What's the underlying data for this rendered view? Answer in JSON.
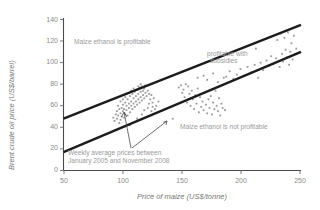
{
  "chart_data": {
    "type": "scatter",
    "title": "",
    "xlabel": "Price of maize (US$/tonne)",
    "ylabel": "Brent crude oil price (US$/barrel)",
    "xlim": [
      50,
      250
    ],
    "ylim": [
      0,
      140
    ],
    "xticks": [
      50,
      100,
      150,
      200,
      250
    ],
    "yticks": [
      0,
      20,
      40,
      60,
      80,
      100,
      120,
      140
    ],
    "grid": false,
    "legend": "none",
    "series": [
      {
        "name": "Weekly average prices",
        "type": "scatter",
        "marker": "square",
        "color": "#9a9a9a",
        "points": [
          [
            92,
            49
          ],
          [
            93,
            46
          ],
          [
            94,
            52
          ],
          [
            95,
            48
          ],
          [
            95,
            55
          ],
          [
            96,
            51
          ],
          [
            97,
            44
          ],
          [
            97,
            57
          ],
          [
            98,
            53
          ],
          [
            98,
            47
          ],
          [
            99,
            58
          ],
          [
            99,
            50
          ],
          [
            100,
            55
          ],
          [
            100,
            61
          ],
          [
            101,
            49
          ],
          [
            101,
            57
          ],
          [
            102,
            52
          ],
          [
            102,
            63
          ],
          [
            103,
            56
          ],
          [
            103,
            60
          ],
          [
            104,
            51
          ],
          [
            104,
            66
          ],
          [
            105,
            58
          ],
          [
            105,
            62
          ],
          [
            106,
            54
          ],
          [
            106,
            69
          ],
          [
            107,
            60
          ],
          [
            107,
            64
          ],
          [
            108,
            57
          ],
          [
            108,
            71
          ],
          [
            109,
            62
          ],
          [
            109,
            67
          ],
          [
            110,
            59
          ],
          [
            110,
            73
          ],
          [
            111,
            64
          ],
          [
            111,
            69
          ],
          [
            112,
            61
          ],
          [
            112,
            75
          ],
          [
            113,
            66
          ],
          [
            113,
            71
          ],
          [
            114,
            63
          ],
          [
            114,
            77
          ],
          [
            115,
            68
          ],
          [
            115,
            73
          ],
          [
            116,
            65
          ],
          [
            116,
            78
          ],
          [
            117,
            70
          ],
          [
            117,
            74
          ],
          [
            118,
            67
          ],
          [
            118,
            76
          ],
          [
            119,
            72
          ],
          [
            120,
            69
          ],
          [
            121,
            74
          ],
          [
            122,
            71
          ],
          [
            123,
            66
          ],
          [
            124,
            70
          ],
          [
            125,
            63
          ],
          [
            126,
            67
          ],
          [
            128,
            60
          ],
          [
            130,
            64
          ],
          [
            106,
            42
          ],
          [
            110,
            45
          ],
          [
            112,
            48
          ],
          [
            116,
            52
          ],
          [
            118,
            56
          ],
          [
            121,
            58
          ],
          [
            124,
            55
          ],
          [
            127,
            57
          ],
          [
            96,
            60
          ],
          [
            98,
            64
          ],
          [
            100,
            66
          ],
          [
            102,
            68
          ],
          [
            104,
            72
          ],
          [
            107,
            74
          ],
          [
            109,
            76
          ],
          [
            113,
            78
          ],
          [
            115,
            80
          ],
          [
            119,
            79
          ],
          [
            122,
            62
          ],
          [
            125,
            59
          ],
          [
            142,
            48
          ],
          [
            147,
            77
          ],
          [
            149,
            79
          ],
          [
            150,
            72
          ],
          [
            151,
            75
          ],
          [
            152,
            68
          ],
          [
            153,
            80
          ],
          [
            154,
            63
          ],
          [
            155,
            78
          ],
          [
            156,
            71
          ],
          [
            157,
            60
          ],
          [
            158,
            74
          ],
          [
            159,
            66
          ],
          [
            160,
            57
          ],
          [
            161,
            70
          ],
          [
            162,
            62
          ],
          [
            163,
            76
          ],
          [
            164,
            54
          ],
          [
            165,
            68
          ],
          [
            166,
            59
          ],
          [
            167,
            64
          ],
          [
            168,
            56
          ],
          [
            169,
            72
          ],
          [
            170,
            61
          ],
          [
            171,
            53
          ],
          [
            172,
            66
          ],
          [
            173,
            58
          ],
          [
            174,
            69
          ],
          [
            175,
            52
          ],
          [
            176,
            63
          ],
          [
            177,
            57
          ],
          [
            178,
            74
          ],
          [
            179,
            60
          ],
          [
            180,
            55
          ],
          [
            181,
            67
          ],
          [
            182,
            51
          ],
          [
            183,
            62
          ],
          [
            184,
            58
          ],
          [
            185,
            86
          ],
          [
            186,
            56
          ],
          [
            163,
            86
          ],
          [
            168,
            88
          ],
          [
            171,
            84
          ],
          [
            176,
            90
          ],
          [
            180,
            82
          ],
          [
            187,
            87
          ],
          [
            190,
            92
          ],
          [
            193,
            85
          ],
          [
            196,
            89
          ],
          [
            199,
            94
          ],
          [
            202,
            88
          ],
          [
            205,
            96
          ],
          [
            208,
            91
          ],
          [
            211,
            98
          ],
          [
            212,
            113
          ],
          [
            214,
            86
          ],
          [
            216,
            100
          ],
          [
            218,
            93
          ],
          [
            221,
            102
          ],
          [
            223,
            97
          ],
          [
            225,
            106
          ],
          [
            227,
            99
          ],
          [
            229,
            104
          ],
          [
            230,
            121
          ],
          [
            232,
            96
          ],
          [
            233,
            127
          ],
          [
            234,
            108
          ],
          [
            235,
            101
          ],
          [
            236,
            123
          ],
          [
            237,
            112
          ],
          [
            238,
            105
          ],
          [
            239,
            128
          ],
          [
            240,
            98
          ],
          [
            241,
            110
          ],
          [
            242,
            118
          ],
          [
            243,
            103
          ],
          [
            244,
            125
          ],
          [
            245,
            108
          ],
          [
            246,
            113
          ],
          [
            247,
            134
          ]
        ]
      }
    ],
    "trend_lines": [
      {
        "name": "upper-profitability-line",
        "x": [
          50,
          250
        ],
        "y": [
          48,
          135
        ],
        "color": "#1c1c1c"
      },
      {
        "name": "lower-profitability-line",
        "x": [
          50,
          250
        ],
        "y": [
          17,
          110
        ],
        "color": "#1c1c1c"
      }
    ],
    "annotations": [
      {
        "name": "maize-ethanol-profitable",
        "text": "Maize ethanol is profitable",
        "x": 98,
        "y": 117
      },
      {
        "name": "profitable-with-subsidies-line1",
        "text": "profitable with",
        "x": 213,
        "y": 103
      },
      {
        "name": "profitable-with-subsidies-line2",
        "text": "subsidies",
        "x": 215,
        "y": 96
      },
      {
        "name": "maize-ethanol-not-profitable",
        "text": "Maize ethanol is not profitable",
        "x": 175,
        "y": 31
      },
      {
        "name": "weekly-caption-line1",
        "text": "Weekly average prices between",
        "x": 88,
        "y": 13
      },
      {
        "name": "weekly-caption-line2",
        "text": "January 2005 and November 2008",
        "x": 88,
        "y": 6
      }
    ]
  }
}
